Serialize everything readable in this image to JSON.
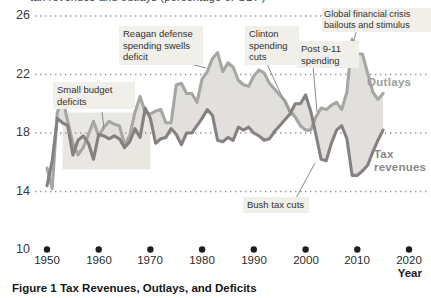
{
  "figure": {
    "top_clipped_text": "tax revenues and outlays (percentage of GDP)",
    "caption": "Figure 1 Tax Revenues, Outlays, and Deficits",
    "year_axis_label": "Year"
  },
  "series_labels": {
    "outlays": "Outlays",
    "revenues": "Tax revenues"
  },
  "annotations": {
    "small_budget": {
      "text": "Small budget deficits",
      "points_to_year": 1961
    },
    "reagan": {
      "text": "Reagan defense spending swells deficit",
      "points_to_year": 1982
    },
    "clinton": {
      "text": "Clinton spending cuts",
      "points_to_year": 1997
    },
    "post911": {
      "text": "Post 9-11 spending",
      "points_to_year": 2002
    },
    "gfc": {
      "text": "Global financial crisis bailouts and stimulus",
      "points_to_year": 2009
    },
    "bush": {
      "text": "Bush tax cuts",
      "points_to_year": 2003
    }
  },
  "chart_data": {
    "type": "line",
    "title": "",
    "xlabel": "Year",
    "ylabel": "",
    "ylim": [
      10,
      26
    ],
    "y_ticks": [
      26,
      22,
      18,
      14,
      10
    ],
    "y_gridlines": [
      26,
      22,
      18,
      14
    ],
    "x_ticks": [
      1950,
      1960,
      1970,
      1980,
      1990,
      2000,
      2010,
      2020
    ],
    "grid": "dotted-horizontal",
    "legend_position": "inline-right",
    "x": [
      1950,
      1951,
      1952,
      1953,
      1954,
      1955,
      1956,
      1957,
      1958,
      1959,
      1960,
      1961,
      1962,
      1963,
      1964,
      1965,
      1966,
      1967,
      1968,
      1969,
      1970,
      1971,
      1972,
      1973,
      1974,
      1975,
      1976,
      1977,
      1978,
      1979,
      1980,
      1981,
      1982,
      1983,
      1984,
      1985,
      1986,
      1987,
      1988,
      1989,
      1990,
      1991,
      1992,
      1993,
      1994,
      1995,
      1996,
      1997,
      1998,
      1999,
      2000,
      2001,
      2002,
      2003,
      2004,
      2005,
      2006,
      2007,
      2008,
      2009,
      2010,
      2011,
      2012,
      2013,
      2014,
      2015
    ],
    "series": [
      {
        "name": "Outlays",
        "color": "#a7a6a3",
        "values": [
          15.6,
          14.2,
          19.4,
          20.4,
          18.8,
          17.3,
          16.5,
          17.0,
          17.9,
          18.8,
          17.8,
          18.4,
          18.8,
          18.6,
          18.5,
          17.2,
          17.8,
          19.4,
          20.5,
          19.4,
          19.3,
          19.5,
          19.6,
          18.7,
          18.7,
          21.3,
          21.4,
          20.7,
          20.7,
          20.1,
          21.7,
          22.2,
          23.1,
          23.5,
          22.2,
          22.8,
          22.5,
          21.6,
          21.3,
          21.2,
          21.9,
          22.3,
          22.1,
          21.4,
          21.0,
          20.6,
          20.2,
          19.5,
          19.1,
          18.5,
          18.2,
          18.2,
          19.1,
          19.7,
          19.6,
          19.9,
          20.1,
          19.6,
          20.8,
          24.4,
          23.4,
          23.4,
          22.1,
          20.8,
          20.3,
          20.7
        ]
      },
      {
        "name": "Tax revenues",
        "color": "#878082",
        "values": [
          14.4,
          16.1,
          19.0,
          18.7,
          18.5,
          16.5,
          17.5,
          17.8,
          17.3,
          16.2,
          17.9,
          17.8,
          17.6,
          17.8,
          17.6,
          17.0,
          17.4,
          18.3,
          17.7,
          19.7,
          19.0,
          17.3,
          17.6,
          17.7,
          18.3,
          17.9,
          17.2,
          18.0,
          18.0,
          18.5,
          19.0,
          19.6,
          19.2,
          17.5,
          17.4,
          17.7,
          17.5,
          18.4,
          18.2,
          18.4,
          18.0,
          17.8,
          17.5,
          17.6,
          18.1,
          18.5,
          18.9,
          19.3,
          20.0,
          20.0,
          20.6,
          19.5,
          17.9,
          16.2,
          16.1,
          17.3,
          18.2,
          18.5,
          17.6,
          15.1,
          15.1,
          15.4,
          15.8,
          16.7,
          17.5,
          18.2
        ]
      }
    ],
    "fill_between": {
      "color": "#e1e0dc",
      "meaning": "deficit / surplus shading between outlays and tax revenues"
    },
    "highlight_region": {
      "years": [
        1953,
        1970
      ],
      "values": [
        15.5,
        19.4
      ],
      "color": "#e8e7e2"
    }
  }
}
